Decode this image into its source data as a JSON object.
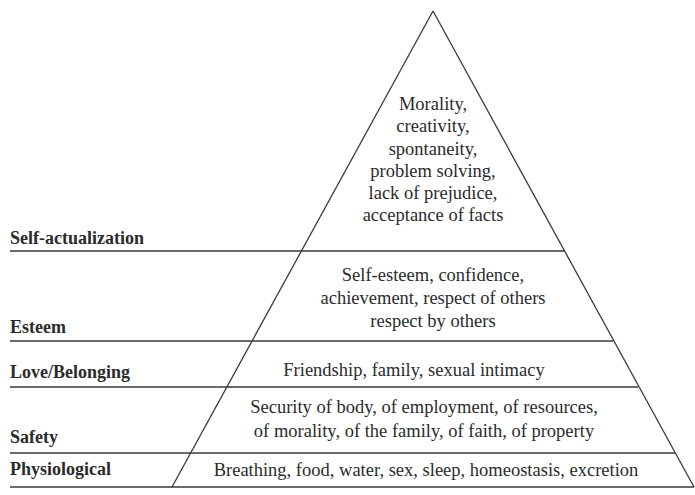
{
  "diagram": {
    "type": "pyramid",
    "title_fragment": "",
    "colors": {
      "line": "#3a3a3a",
      "text": "#2b2b2b",
      "background": "#ffffff"
    },
    "tiers": [
      {
        "label": "Self-actualization",
        "lines": [
          "Morality,",
          "creativity,",
          "spontaneity,",
          "problem solving,",
          "lack of prejudice,",
          "acceptance of facts"
        ]
      },
      {
        "label": "Esteem",
        "lines": [
          "Self-esteem, confidence,",
          "achievement, respect of others",
          "respect by others"
        ]
      },
      {
        "label": "Love/Belonging",
        "lines": [
          "Friendship, family, sexual intimacy"
        ]
      },
      {
        "label": "Safety",
        "lines": [
          "Security of body, of employment, of resources,",
          "of morality, of the family, of faith, of property"
        ]
      },
      {
        "label": "Physiological",
        "lines": [
          "Breathing, food, water, sex, sleep, homeostasis, excretion"
        ]
      }
    ]
  }
}
